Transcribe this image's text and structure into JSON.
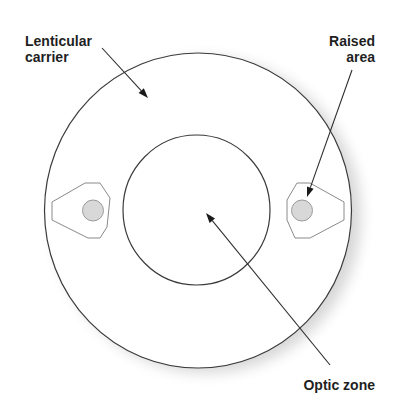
{
  "diagram": {
    "labels": {
      "lenticular_carrier_line1": "Lenticular",
      "lenticular_carrier_line2": "carrier",
      "raised_area_line1": "Raised",
      "raised_area_line2": "area",
      "optic_zone": "Optic zone"
    },
    "parts": [
      {
        "id": "lenticular-carrier",
        "label": "Lenticular carrier",
        "shape": "outer circle"
      },
      {
        "id": "optic-zone",
        "label": "Optic zone",
        "shape": "inner circle"
      },
      {
        "id": "raised-area-left",
        "label": "Raised area",
        "shape": "lug with shaded dot"
      },
      {
        "id": "raised-area-right",
        "label": "Raised area",
        "shape": "lug with shaded dot"
      }
    ],
    "colors": {
      "outline": "#3a3a3a",
      "lug_outline": "#8a8a8a",
      "raised_fill": "#d8d8d8",
      "text": "#1f1f1f",
      "background": "#ffffff"
    }
  }
}
